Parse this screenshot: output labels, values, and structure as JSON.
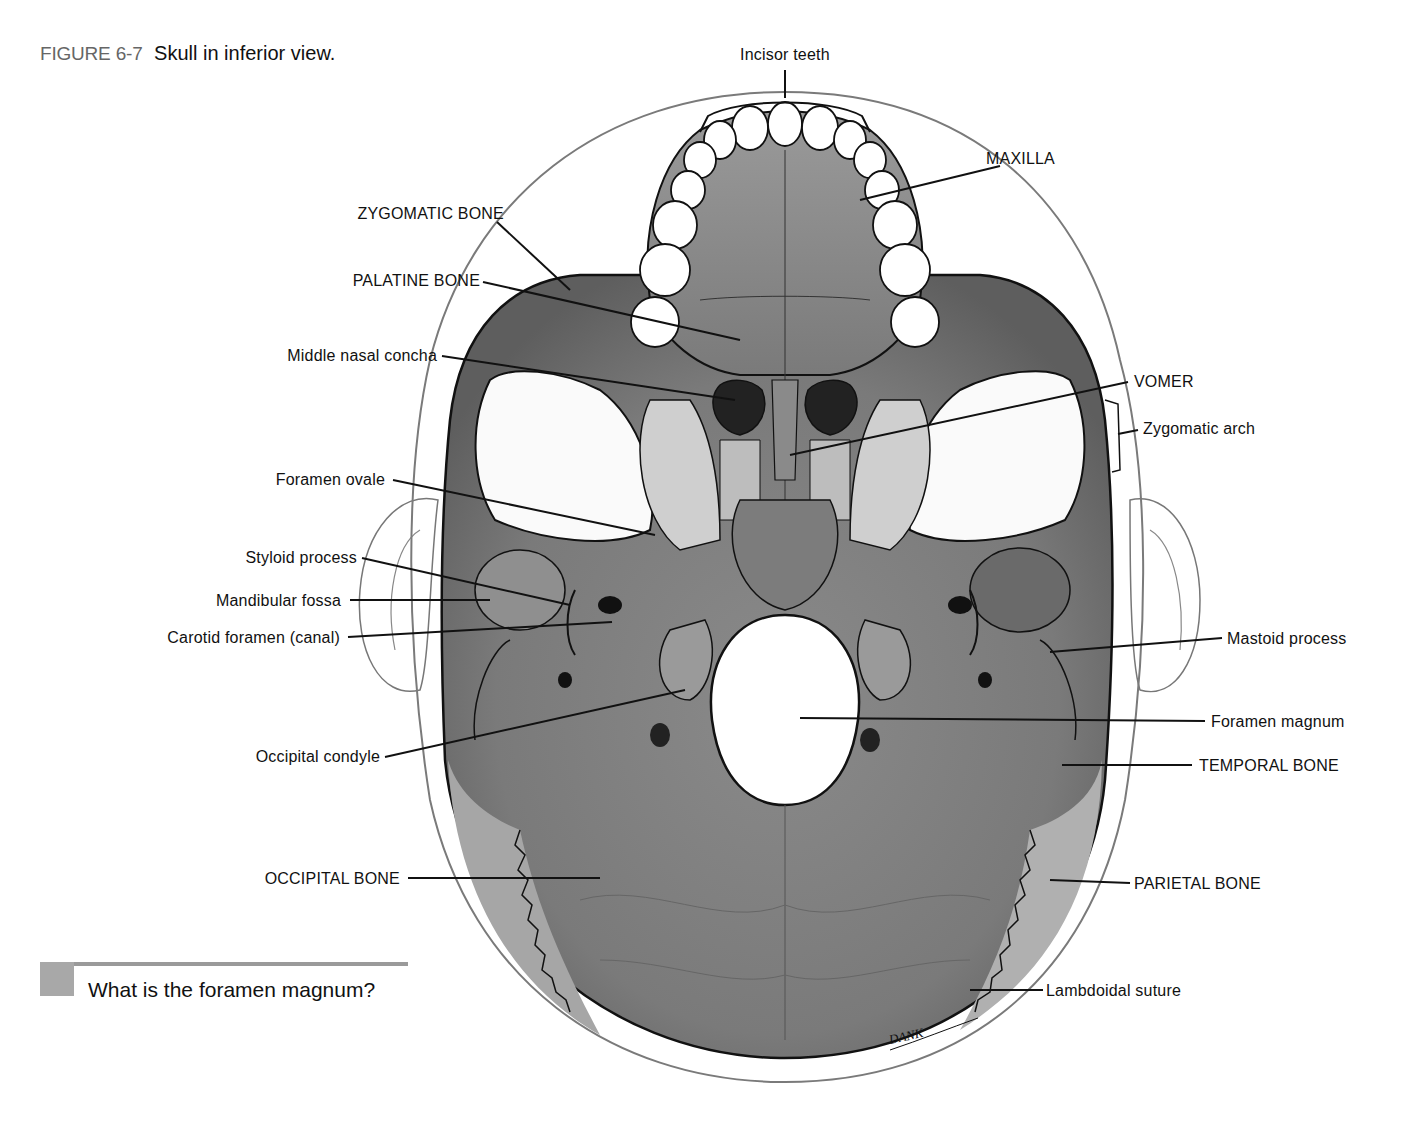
{
  "figure": {
    "number": "FIGURE 6-7",
    "title": "Skull in inferior view."
  },
  "question": "What is the foramen magnum?",
  "signature": "DANK",
  "labels": {
    "left": [
      {
        "id": "zygomatic-bone",
        "text": "ZYGOMATIC BONE"
      },
      {
        "id": "palatine-bone",
        "text": "PALATINE BONE"
      },
      {
        "id": "middle-nasal-concha",
        "text": "Middle nasal concha"
      },
      {
        "id": "foramen-ovale",
        "text": "Foramen ovale"
      },
      {
        "id": "styloid-process",
        "text": "Styloid process"
      },
      {
        "id": "mandibular-fossa",
        "text": "Mandibular fossa"
      },
      {
        "id": "carotid-foramen",
        "text": "Carotid foramen (canal)"
      },
      {
        "id": "occipital-condyle",
        "text": "Occipital condyle"
      },
      {
        "id": "occipital-bone",
        "text": "OCCIPITAL BONE"
      }
    ],
    "top": [
      {
        "id": "incisor-teeth",
        "text": "Incisor teeth"
      }
    ],
    "right": [
      {
        "id": "maxilla",
        "text": "MAXILLA"
      },
      {
        "id": "vomer",
        "text": "VOMER"
      },
      {
        "id": "zygomatic-arch",
        "text": "Zygomatic arch"
      },
      {
        "id": "mastoid-process",
        "text": "Mastoid process"
      },
      {
        "id": "foramen-magnum",
        "text": "Foramen magnum"
      },
      {
        "id": "temporal-bone",
        "text": "TEMPORAL BONE"
      },
      {
        "id": "parietal-bone",
        "text": "PARIETAL BONE"
      },
      {
        "id": "lambdoidal-suture",
        "text": "Lambdoidal suture"
      }
    ]
  },
  "colors": {
    "bone_dark": "#6f6f6f",
    "bone_mid": "#8c8c8c",
    "bone_light": "#b4b4b4",
    "outline": "#1a1a1a",
    "head_outline": "#777777",
    "foramen": "#ffffff"
  }
}
